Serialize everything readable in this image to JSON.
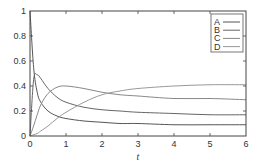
{
  "chart_data": {
    "type": "line",
    "title": "",
    "xlabel": "t",
    "ylabel": "",
    "xlim": [
      0,
      6
    ],
    "ylim": [
      0,
      1
    ],
    "grid": false,
    "legend_position": "upper right",
    "x_ticks": [
      "0",
      "1",
      "2",
      "3",
      "4",
      "5",
      "6"
    ],
    "y_ticks": [
      "0",
      "0.2",
      "0.4",
      "0.6",
      "0.8",
      "1"
    ],
    "x": [
      0,
      0.1,
      0.2,
      0.3,
      0.5,
      0.75,
      1,
      1.5,
      2,
      2.5,
      3,
      4,
      5,
      6
    ],
    "series": [
      {
        "name": "A",
        "color": "#555555",
        "values": [
          1.0,
          0.55,
          0.35,
          0.27,
          0.2,
          0.16,
          0.14,
          0.12,
          0.11,
          0.1,
          0.1,
          0.09,
          0.09,
          0.09
        ]
      },
      {
        "name": "B",
        "color": "#666666",
        "values": [
          0.0,
          0.45,
          0.49,
          0.46,
          0.38,
          0.31,
          0.27,
          0.23,
          0.21,
          0.2,
          0.19,
          0.18,
          0.17,
          0.17
        ]
      },
      {
        "name": "C",
        "color": "#888888",
        "values": [
          0.0,
          0.08,
          0.17,
          0.25,
          0.34,
          0.39,
          0.4,
          0.38,
          0.35,
          0.33,
          0.32,
          0.3,
          0.3,
          0.29
        ]
      },
      {
        "name": "D",
        "color": "#999999",
        "values": [
          0.0,
          0.01,
          0.02,
          0.04,
          0.08,
          0.14,
          0.19,
          0.27,
          0.33,
          0.36,
          0.38,
          0.4,
          0.41,
          0.41
        ]
      }
    ]
  }
}
